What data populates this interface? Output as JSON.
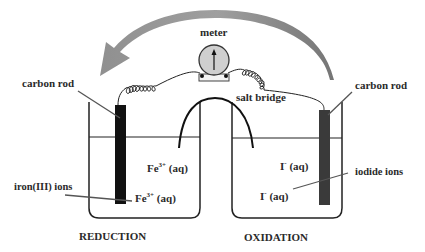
{
  "diagram": {
    "type": "electrochemical cell",
    "colors": {
      "arrow": "#7a7a7a",
      "rod_left": "#111111",
      "rod_right": "#3a3a3a",
      "meter_face": "#cfcfcf",
      "lines": "#222222",
      "text": "#2a2a2a"
    },
    "labels": {
      "meter": "meter",
      "salt_bridge": "salt bridge",
      "carbon_rod_left": "carbon rod",
      "carbon_rod_right": "carbon rod",
      "iron_ions": "iron(III) ions",
      "iodide_ions": "iodide ions",
      "fe_upper_base": "Fe",
      "fe_upper_sup": "3+",
      "fe_upper_tail": " (aq)",
      "fe_lower_base": "Fe",
      "fe_lower_sup": "3+",
      "fe_lower_tail": " (aq)",
      "i_upper_base": "I",
      "i_upper_sup": "-",
      "i_upper_tail": " (aq)",
      "i_lower_base": "I",
      "i_lower_sup": "-",
      "i_lower_tail": " (aq)",
      "left_caption": "REDUCTION",
      "right_caption": "OXIDATION"
    }
  }
}
